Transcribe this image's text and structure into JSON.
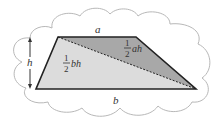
{
  "diagram": {
    "labels": {
      "top_side": "a",
      "bottom_side": "b",
      "height": "h",
      "upper_triangle_num": "1",
      "upper_triangle_den": "2",
      "upper_triangle_expr": "ah",
      "lower_triangle_num": "1",
      "lower_triangle_den": "2",
      "lower_triangle_expr": "bh"
    },
    "colors": {
      "upper_triangle": "#a8a8a8",
      "lower_triangle": "#dcdcdc",
      "outline": "#222222",
      "cloud": "#b8b8b8"
    }
  }
}
